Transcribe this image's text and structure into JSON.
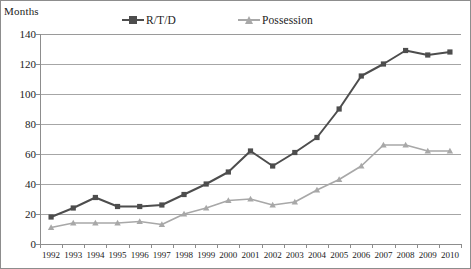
{
  "chart_data": {
    "type": "line",
    "title": "",
    "subtitle": "",
    "xlabel": "",
    "ylabel": "Months",
    "categories": [
      "1992",
      "1993",
      "1994",
      "1995",
      "1996",
      "1997",
      "1998",
      "1999",
      "2000",
      "2001",
      "2002",
      "2003",
      "2004",
      "2005",
      "2006",
      "2007",
      "2008",
      "2009",
      "2010"
    ],
    "series": [
      {
        "name": "R/T/D",
        "color": "#4d4d4d",
        "marker": "square",
        "values": [
          18,
          24,
          31,
          25,
          25,
          26,
          33,
          40,
          48,
          62,
          52,
          61,
          71,
          90,
          112,
          120,
          129,
          126,
          128
        ]
      },
      {
        "name": "Possession",
        "color": "#a8a8a8",
        "marker": "triangle",
        "values": [
          11,
          14,
          14,
          14,
          15,
          13,
          20,
          24,
          29,
          30,
          26,
          28,
          36,
          43,
          52,
          66,
          66,
          62,
          62
        ]
      }
    ],
    "ylim": [
      0,
      140
    ],
    "yticks": [
      0,
      20,
      40,
      60,
      80,
      100,
      120,
      140
    ],
    "ytick_labels": [
      "0",
      "20",
      "40",
      "60",
      "80",
      "100",
      "120",
      "140"
    ],
    "grid": true,
    "grid_axis": "y",
    "legend_position": "top",
    "colors": {
      "axis": "#8d8d8d",
      "grid": "#a6a6a6",
      "text": "#1b1b1b",
      "background": "#ffffff",
      "series_rtd": "#4d4d4d",
      "series_possession": "#a8a8a8"
    }
  }
}
